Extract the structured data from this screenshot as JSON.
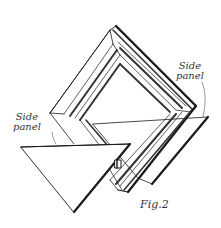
{
  "figure": {
    "caption": "Fig.2",
    "labels": {
      "right_panel_line1": "Side",
      "right_panel_line2": "panel",
      "left_panel_line1": "Side",
      "left_panel_line2": "panel"
    },
    "colors": {
      "ink": "#1a1a1a",
      "hatch": "#333333",
      "paper": "#ffffff"
    }
  }
}
